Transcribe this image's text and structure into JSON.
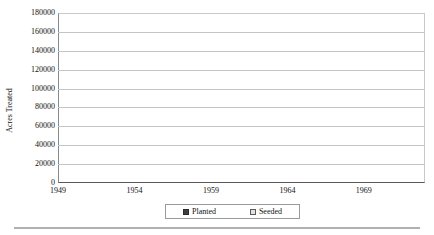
{
  "caption": {
    "text": " "
  },
  "legend": {
    "position": "bottom-center",
    "entries": [
      {
        "label": "Planted",
        "icon": "filled-square-icon",
        "color": "#3f3f3f"
      },
      {
        "label": "Seeded",
        "icon": "open-square-icon",
        "color": "#e2e2e2"
      }
    ]
  },
  "colors": {
    "planted_fill": "#484848",
    "seeded_fill": "#c8c8c8",
    "seeded_pattern": "#e8e8e8",
    "gridline": "#c4c4c4",
    "axis": "#5a5a5a",
    "text": "#111111"
  },
  "chart_data": {
    "type": "area",
    "stacked": true,
    "title": "",
    "xlabel": "",
    "ylabel": "Acres Treated",
    "ylim": [
      0,
      180000
    ],
    "ytick_step": 20000,
    "ytick_labels": [
      "180000",
      "160000",
      "140000",
      "120000",
      "100000",
      "80000",
      "60000",
      "40000",
      "20000",
      "0"
    ],
    "xlim": [
      1949,
      1973
    ],
    "xtick_labels": [
      "1949",
      "1954",
      "1959",
      "1964",
      "1969"
    ],
    "xtick_values": [
      1949,
      1954,
      1959,
      1964,
      1969
    ],
    "grid": true,
    "x": [
      1949,
      1950,
      1951,
      1952,
      1953,
      1954,
      1955,
      1956,
      1957,
      1958,
      1959,
      1960,
      1961,
      1962,
      1963,
      1964,
      1965,
      1966,
      1967,
      1968,
      1969,
      1970,
      1971,
      1972,
      1973
    ],
    "series": [
      {
        "name": "Planted",
        "values": [
          11000,
          10000,
          9000,
          9000,
          10000,
          10000,
          10000,
          11000,
          18000,
          25000,
          25000,
          25000,
          26000,
          22000,
          24000,
          25000,
          29000,
          35000,
          35000,
          42000,
          48000,
          56000,
          73000,
          85000,
          96000
        ]
      },
      {
        "name": "Seeded",
        "values": [
          3000,
          1000,
          1000,
          1000,
          1000,
          1000,
          1000,
          33000,
          42000,
          34000,
          38000,
          49000,
          47000,
          45000,
          46000,
          38000,
          49000,
          69000,
          61000,
          56000,
          67000,
          55000,
          50000,
          31000,
          61000
        ]
      }
    ],
    "totals": [
      14000,
      11000,
      10000,
      10000,
      11000,
      11000,
      11000,
      44000,
      60000,
      59000,
      63000,
      74000,
      73000,
      67000,
      70000,
      63000,
      78000,
      104000,
      96000,
      98000,
      115000,
      111000,
      123000,
      116000,
      157000
    ]
  }
}
